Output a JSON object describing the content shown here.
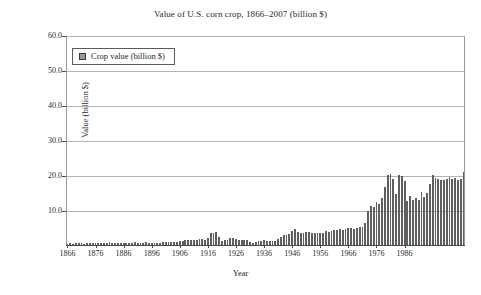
{
  "chart_data": {
    "type": "bar",
    "title": "Value of U.S. corn crop, 1866–2007 (billion $)",
    "xlabel": "Year",
    "ylabel": "Value (billion $)",
    "ylim": [
      0,
      60
    ],
    "ytick_labels": [
      "60.0",
      "50.0",
      "40.0",
      "30.0",
      "20.0",
      "10.0"
    ],
    "ytick_values": [
      60,
      50,
      40,
      30,
      20,
      10
    ],
    "xlim": [
      1866,
      2007
    ],
    "xtick_labels": [
      "1866",
      "1876",
      "1886",
      "1896",
      "1906",
      "1916",
      "1926",
      "1936",
      "1946",
      "1956",
      "1966",
      "1976",
      "1986"
    ],
    "xtick_values": [
      1866,
      1876,
      1886,
      1896,
      1906,
      1916,
      1926,
      1936,
      1946,
      1956,
      1966,
      1976,
      1986
    ],
    "grid": true,
    "legend_position": "top-left",
    "bar_color": "#5f5f5f",
    "series": [
      {
        "name": "Crop value (billion $)",
        "x": [
          1866,
          1867,
          1868,
          1869,
          1870,
          1871,
          1872,
          1873,
          1874,
          1875,
          1876,
          1877,
          1878,
          1879,
          1880,
          1881,
          1882,
          1883,
          1884,
          1885,
          1886,
          1887,
          1888,
          1889,
          1890,
          1891,
          1892,
          1893,
          1894,
          1895,
          1896,
          1897,
          1898,
          1899,
          1900,
          1901,
          1902,
          1903,
          1904,
          1905,
          1906,
          1907,
          1908,
          1909,
          1910,
          1911,
          1912,
          1913,
          1914,
          1915,
          1916,
          1917,
          1918,
          1919,
          1920,
          1921,
          1922,
          1923,
          1924,
          1925,
          1926,
          1927,
          1928,
          1929,
          1930,
          1931,
          1932,
          1933,
          1934,
          1935,
          1936,
          1937,
          1938,
          1939,
          1940,
          1941,
          1942,
          1943,
          1944,
          1945,
          1946,
          1947,
          1948,
          1949,
          1950,
          1951,
          1952,
          1953,
          1954,
          1955,
          1956,
          1957,
          1958,
          1959,
          1960,
          1961,
          1962,
          1963,
          1964,
          1965,
          1966,
          1967,
          1968,
          1969,
          1970,
          1971,
          1972,
          1973,
          1974,
          1975,
          1976,
          1977,
          1978,
          1979,
          1980,
          1981,
          1982,
          1983,
          1984,
          1985,
          1986,
          1987,
          1988,
          1989,
          1990,
          1991,
          1992,
          1993,
          1994,
          1995,
          1996,
          1997,
          1998,
          1999,
          2000,
          2001,
          2002,
          2003,
          2004,
          2005,
          2006,
          2007
        ],
        "values": [
          0.4,
          0.45,
          0.42,
          0.5,
          0.48,
          0.44,
          0.43,
          0.47,
          0.52,
          0.5,
          0.46,
          0.48,
          0.45,
          0.55,
          0.6,
          0.75,
          0.65,
          0.6,
          0.58,
          0.55,
          0.57,
          0.65,
          0.62,
          0.58,
          0.75,
          0.7,
          0.64,
          0.66,
          0.78,
          0.62,
          0.58,
          0.64,
          0.68,
          0.65,
          0.72,
          0.92,
          0.8,
          0.85,
          0.95,
          0.98,
          1.02,
          1.25,
          1.35,
          1.45,
          1.42,
          1.55,
          1.52,
          1.7,
          1.72,
          1.55,
          2.1,
          3.45,
          3.5,
          3.6,
          2.2,
          1.25,
          1.55,
          1.45,
          1.9,
          2.0,
          1.6,
          1.55,
          1.5,
          1.45,
          1.35,
          0.85,
          0.55,
          0.85,
          1.1,
          1.25,
          1.3,
          1.25,
          1.05,
          1.1,
          1.25,
          1.7,
          2.3,
          2.85,
          2.9,
          3.05,
          4.1,
          4.45,
          3.6,
          3.4,
          3.55,
          3.85,
          3.75,
          3.55,
          3.4,
          3.5,
          3.55,
          3.45,
          3.9,
          3.85,
          3.95,
          4.2,
          4.15,
          4.45,
          4.3,
          4.7,
          5.0,
          4.8,
          4.55,
          4.9,
          5.05,
          5.1,
          6.3,
          9.7,
          11.2,
          11.0,
          12.2,
          11.6,
          13.5,
          16.5,
          20.1,
          20.3,
          19.0,
          14.7,
          19.9,
          19.6,
          18.3,
          12.6,
          14.1,
          13.0,
          13.4,
          12.8,
          15.2,
          13.6,
          15.0,
          17.4,
          20.0,
          19.2,
          18.9,
          18.5,
          18.6,
          18.8,
          19.5,
          18.9,
          19.2,
          18.6,
          19.0,
          21.0
        ]
      }
    ]
  },
  "legend": {
    "label": "Crop value (billion $)",
    "swatch_name": "crop-value-swatch"
  }
}
